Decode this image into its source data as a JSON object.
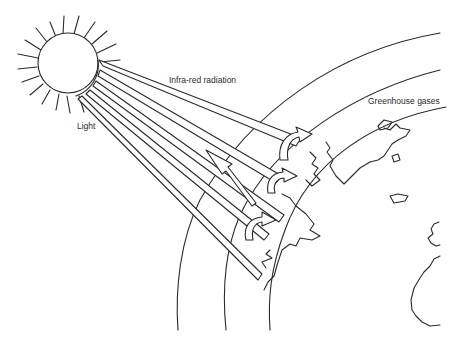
{
  "diagram": {
    "labels": {
      "light": "Light",
      "infrared": "Infra-red radiation",
      "greenhouse": "Greenhouse gases"
    },
    "elements": [
      "sun",
      "light-beams",
      "infra-red-beams",
      "atmosphere-layers",
      "earth-coastlines",
      "reflection-arrows"
    ],
    "colors": {
      "line": "#2a2a2a",
      "background": "#ffffff"
    }
  }
}
